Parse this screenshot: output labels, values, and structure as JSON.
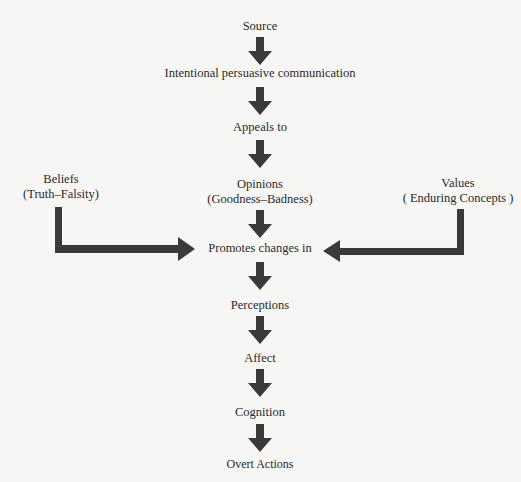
{
  "diagram": {
    "arrow_color": "#3a3a3a",
    "background": "#f6f6f4",
    "main_flow": [
      {
        "id": "source",
        "label": "Source"
      },
      {
        "id": "communication",
        "label": "Intentional persuasive communication"
      },
      {
        "id": "appeals",
        "label": "Appeals to"
      },
      {
        "id": "opinions",
        "label": "Opinions",
        "sublabel": "(Goodness–Badness)"
      },
      {
        "id": "promotes",
        "label": "Promotes changes in"
      },
      {
        "id": "perceptions",
        "label": "Perceptions"
      },
      {
        "id": "affect",
        "label": "Affect"
      },
      {
        "id": "cognition",
        "label": "Cognition"
      },
      {
        "id": "actions",
        "label": "Overt Actions"
      }
    ],
    "side_inputs": {
      "beliefs": {
        "label": "Beliefs",
        "sublabel": "(Truth–Falsity)",
        "target": "promotes"
      },
      "values": {
        "label": "Values",
        "sublabel": "( Enduring Concepts )",
        "target": "promotes"
      }
    },
    "edges": [
      [
        "source",
        "communication"
      ],
      [
        "communication",
        "appeals"
      ],
      [
        "appeals",
        "opinions"
      ],
      [
        "opinions",
        "promotes"
      ],
      [
        "beliefs",
        "promotes"
      ],
      [
        "values",
        "promotes"
      ],
      [
        "promotes",
        "perceptions"
      ],
      [
        "perceptions",
        "affect"
      ],
      [
        "affect",
        "cognition"
      ],
      [
        "cognition",
        "actions"
      ]
    ]
  }
}
